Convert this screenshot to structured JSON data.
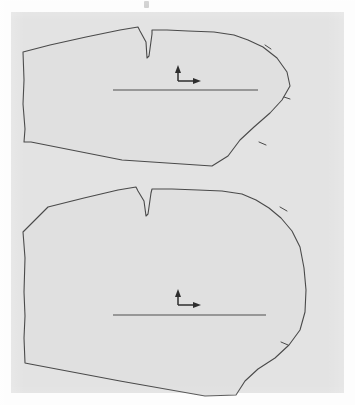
{
  "document": {
    "kind": "scanned-technical-drawing",
    "title": "Garment pattern pieces",
    "width_px": 355,
    "height_px": 405,
    "background_color": "#fdfdfd",
    "panel_color": "#e3e3e3",
    "outline_color": "#4a4a4a",
    "fill_color": "#e0e0e0",
    "marker_color": "#2e2e2e"
  },
  "panel": {
    "left": 11,
    "top": 12,
    "width": 333,
    "height": 381,
    "artifact_label": "scan-speck"
  },
  "pieces": [
    {
      "id": "upper-pattern-piece",
      "label": "Upper pattern piece",
      "description": "Tapered panel with V-notch dart on top edge and rounded bulge on right side",
      "outline_path": "M 23 52 L 24 80 L 23 104 L 25 129 L 24 142 L 31 142 L 122 160 L 212 166 L 228 156 L 240 140 L 254 127 L 270 113 L 282 100 L 290 86 L 287 72 L 277 58 L 263 47 L 248 40 L 234 35 L 214 32 L 188 31 L 167 30 L 152 30 L 152 34 L 149 56 L 147 58 L 146 42 L 140 31 L 138 27 L 120 30 L 86 37 L 50 45 Z",
      "dart_notch": {
        "left_x": 138,
        "apex_x": 147,
        "apex_y": 58,
        "right_x": 152
      },
      "grainline": {
        "x1": 113,
        "y1": 90,
        "x2": 258,
        "y2": 90
      },
      "axis_marker": {
        "corner_x": 178,
        "corner_y": 81,
        "up_y": 67,
        "right_x": 200
      },
      "edge_notches": [
        {
          "x": 268,
          "y": 47
        },
        {
          "x": 286,
          "y": 99
        },
        {
          "x": 262,
          "y": 143
        }
      ]
    },
    {
      "id": "lower-pattern-piece",
      "label": "Lower pattern piece",
      "description": "Wider panel with V-notch dart on top edge and flatter rounded right side",
      "outline_path": "M 23 232 L 25 258 L 24 292 L 25 316 L 24 338 L 25 363 L 30 364 L 120 381 L 205 396 L 236 395 L 245 381 L 258 369 L 275 358 L 289 345 L 300 330 L 305 312 L 306 290 L 304 268 L 300 247 L 292 231 L 281 218 L 269 208 L 256 200 L 242 194 L 222 191 L 198 190 L 172 189 L 152 189 L 151 193 L 148 214 L 146 216 L 144 201 L 138 191 L 136 187 L 118 190 L 84 198 L 48 207 Z",
      "dart_notch": {
        "left_x": 136,
        "apex_x": 146,
        "apex_y": 216,
        "right_x": 151
      },
      "grainline": {
        "x1": 113,
        "y1": 315,
        "x2": 266,
        "y2": 315
      },
      "axis_marker": {
        "corner_x": 178,
        "corner_y": 305,
        "up_y": 291,
        "right_x": 200
      },
      "edge_notches": [
        {
          "x": 283,
          "y": 209
        },
        {
          "x": 284,
          "y": 343
        }
      ]
    }
  ],
  "markers": {
    "axis_name": "grain-axis-arrow",
    "axis_description": "L-shaped coordinate marker with arrowheads pointing up and right",
    "grainline_name": "grainline"
  }
}
